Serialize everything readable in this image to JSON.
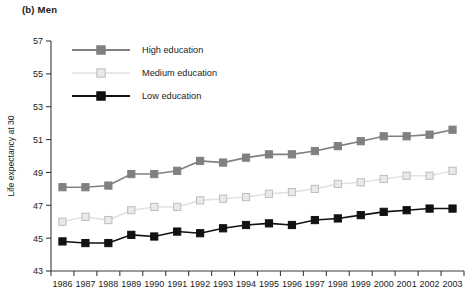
{
  "panel": {
    "title": "(b) Men"
  },
  "chart_data": {
    "type": "line",
    "title": "(b) Men",
    "xlabel": "",
    "ylabel": "Life expectancy at 30",
    "x": [
      1986,
      1987,
      1988,
      1989,
      1990,
      1991,
      1992,
      1993,
      1994,
      1995,
      1996,
      1997,
      1998,
      1999,
      2000,
      2001,
      2002,
      2003
    ],
    "xtick_labels": [
      "1986",
      "1987",
      "1988",
      "1989",
      "1990",
      "1991",
      "1992",
      "1993",
      "1994",
      "1995",
      "1996",
      "1997",
      "1998",
      "1999",
      "2000",
      "2001",
      "2002",
      "2003"
    ],
    "ytick_labels": [
      "43",
      "45",
      "47",
      "49",
      "51",
      "53",
      "55",
      "57"
    ],
    "yticks": [
      43,
      45,
      47,
      49,
      51,
      53,
      55,
      57
    ],
    "ylim": [
      43,
      57
    ],
    "grid": false,
    "legend_position": "top-left-inside",
    "series": [
      {
        "name": "High education",
        "marker": "filled-square",
        "color": "#808080",
        "line_color": "#808080",
        "values": [
          48.1,
          48.1,
          48.2,
          48.9,
          48.9,
          49.1,
          49.7,
          49.6,
          49.9,
          50.1,
          50.1,
          50.3,
          50.6,
          50.9,
          51.2,
          51.2,
          51.3,
          51.6
        ]
      },
      {
        "name": "Medium education",
        "marker": "open-square",
        "color": "#d5d5d5",
        "line_color": "#e2e2e2",
        "values": [
          46.0,
          46.3,
          46.1,
          46.7,
          46.9,
          46.9,
          47.3,
          47.4,
          47.5,
          47.7,
          47.8,
          48.0,
          48.3,
          48.4,
          48.6,
          48.8,
          48.8,
          49.1
        ]
      },
      {
        "name": "Low education",
        "marker": "filled-square",
        "color": "#111111",
        "line_color": "#111111",
        "values": [
          44.8,
          44.7,
          44.7,
          45.2,
          45.1,
          45.4,
          45.3,
          45.6,
          45.8,
          45.9,
          45.8,
          46.1,
          46.2,
          46.4,
          46.6,
          46.7,
          46.8,
          46.8
        ]
      }
    ]
  },
  "legend": {
    "items": [
      {
        "label": "High education"
      },
      {
        "label": "Medium education"
      },
      {
        "label": "Low education"
      }
    ]
  }
}
